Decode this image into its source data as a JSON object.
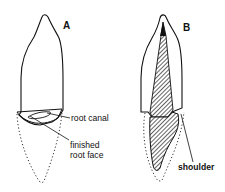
{
  "figure": {
    "panels": [
      {
        "id": "A",
        "letter": "A",
        "labels": {
          "root_canal": "root canal",
          "finished_root_face_line1": "finished",
          "finished_root_face_line2": "root face"
        }
      },
      {
        "id": "B",
        "letter": "B",
        "labels": {
          "shoulder": "shoulder"
        }
      }
    ],
    "colors": {
      "line": "#111111",
      "background": "#ffffff"
    }
  }
}
